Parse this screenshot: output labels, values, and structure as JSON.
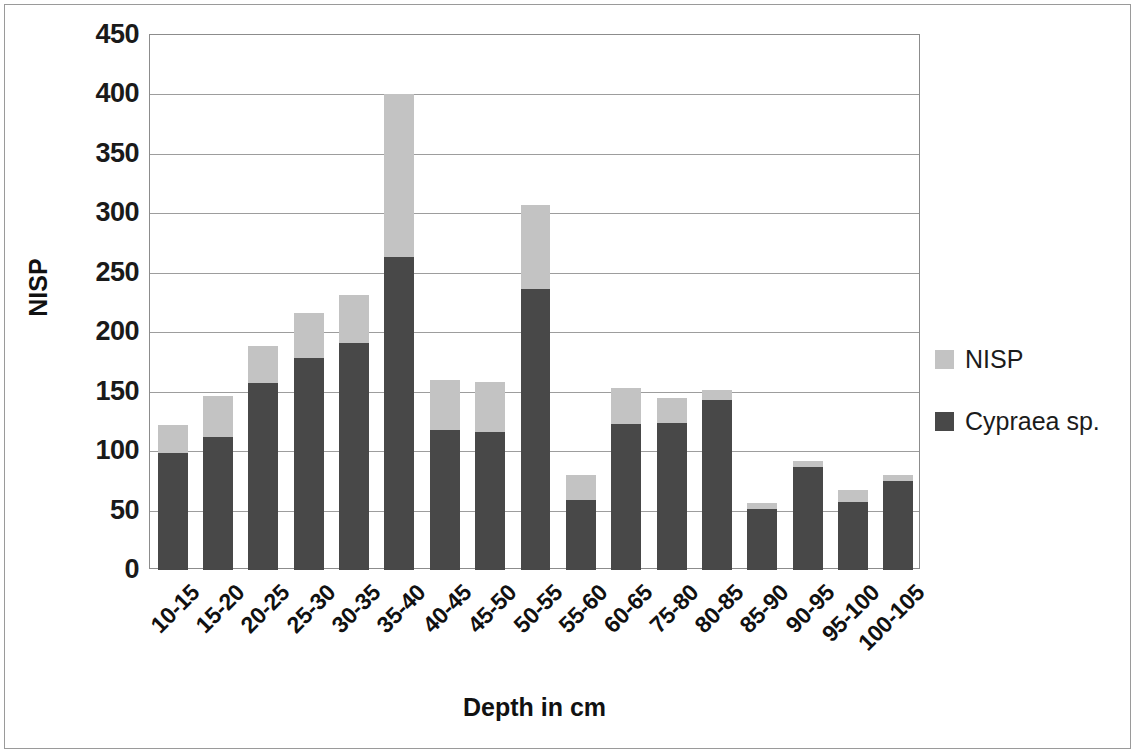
{
  "chart_data": {
    "type": "bar",
    "subtype": "stacked",
    "title": "",
    "xlabel": "Depth in cm",
    "ylabel": "NISP",
    "ylim": [
      0,
      450
    ],
    "ytick_step": 50,
    "yticks": [
      "450",
      "400",
      "350",
      "300",
      "250",
      "200",
      "150",
      "100",
      "50",
      "0"
    ],
    "grid": "horizontal",
    "legend_position": "right",
    "categories": [
      "10-15",
      "15-20",
      "20-25",
      "25-30",
      "30-35",
      "35-40",
      "40-45",
      "45-50",
      "50-55",
      "55-60",
      "60-65",
      "75-80",
      "80-85",
      "85-90",
      "90-95",
      "95-100",
      "100-105"
    ],
    "series": [
      {
        "name": "Cypraea sp.",
        "color": "#484848",
        "values": [
          98,
          112,
          157,
          178,
          191,
          263,
          118,
          116,
          236,
          59,
          123,
          124,
          143,
          51,
          87,
          57,
          75
        ]
      },
      {
        "name": "NISP",
        "color": "#c3c3c3",
        "values": [
          122,
          146,
          188,
          216,
          231,
          400,
          160,
          158,
          307,
          80,
          153,
          145,
          151,
          56,
          92,
          67,
          80
        ]
      }
    ]
  },
  "legend": {
    "items": [
      {
        "label": "NISP",
        "color": "#c3c3c3"
      },
      {
        "label": "Cypraea sp.",
        "color": "#484848"
      }
    ]
  },
  "axes": {
    "y_title": "NISP",
    "x_title": "Depth in cm"
  }
}
